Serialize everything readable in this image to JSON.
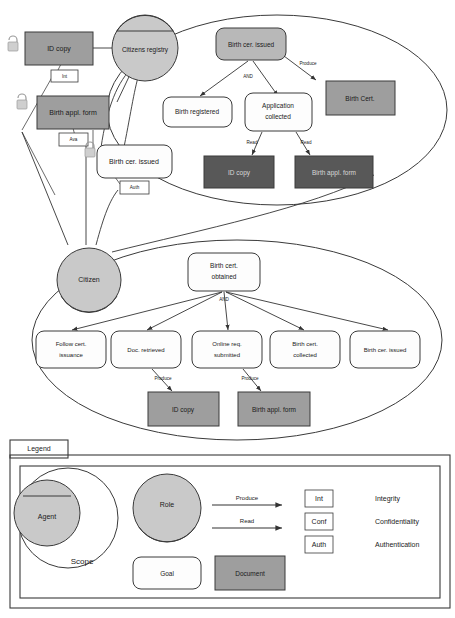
{
  "diagram": {
    "colors": {
      "document": "#9e9e9e",
      "document_dark": "#585858",
      "agent": "#c9c9c9",
      "goal": "#fdfdfd",
      "goal_shaded": "#b8b8b8",
      "stroke": "#3a3a3a"
    }
  },
  "scope_top": {
    "agent": "Citizens registry",
    "root_goal": "Birth cer. issued",
    "and_label": "AND",
    "subgoals": [
      "Birth registered",
      "Application collected"
    ],
    "documents": [
      {
        "name": "Birth Cert.",
        "shade": "light"
      },
      {
        "name": "ID copy",
        "shade": "dark"
      },
      {
        "name": "Birth appl. form",
        "shade": "dark"
      }
    ],
    "edge_labels": {
      "produce": "Produce",
      "read_left": "Read",
      "read_right": "Read"
    }
  },
  "outside": {
    "documents": [
      {
        "name": "ID copy"
      },
      {
        "name": "Birth appl. form"
      }
    ],
    "goal": "Birth cer. issued",
    "attributes": [
      {
        "code": "Int"
      },
      {
        "code": "Ava"
      },
      {
        "code": "Auth"
      }
    ],
    "locks": [
      "lock-icon",
      "lock-icon",
      "lock-icon"
    ]
  },
  "scope_bottom": {
    "role": "Citizen",
    "root_goal": "Birth cert. obtained",
    "and_label": "AND",
    "subgoals": [
      "Follow cert. issuance",
      "Doc. retrieved",
      "Online req. submitted",
      "Birth cert. collected",
      "Birth cer. issued"
    ],
    "documents": [
      {
        "name": "ID copy"
      },
      {
        "name": "Birth appl. form"
      }
    ],
    "edge_labels": {
      "produce_left": "Produce",
      "produce_right": "Produce"
    }
  },
  "legend": {
    "title": "Legend",
    "agent": "Agent",
    "scope": "Scope",
    "role": "Role",
    "goal": "Goal",
    "document": "Document",
    "arrows": [
      {
        "label": "Produce"
      },
      {
        "label": "Read"
      }
    ],
    "attributes": [
      {
        "code": "Int",
        "meaning": "Integrity"
      },
      {
        "code": "Conf",
        "meaning": "Confidentiality"
      },
      {
        "code": "Auth",
        "meaning": "Authentication"
      }
    ]
  }
}
